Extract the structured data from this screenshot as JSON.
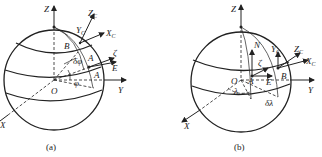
{
  "figure": {
    "panels": [
      {
        "id": "a",
        "caption": "(a)",
        "axes": {
          "z": "Z",
          "y": "Y",
          "x": "X",
          "zc": "Z",
          "zc_sub": "C",
          "yc": "Y",
          "yc_sub": "C",
          "xc": "X",
          "xc_sub": "C",
          "zeta": "ζ",
          "e": "E"
        },
        "points": {
          "origin": "O",
          "a_upper": "A",
          "a_lower": "A",
          "b": "B"
        },
        "angles": {
          "phi": "φ",
          "delta_phi": "δφ"
        }
      },
      {
        "id": "b",
        "caption": "(b)",
        "axes": {
          "z": "Z",
          "y": "Y",
          "x": "X",
          "zc": "Z",
          "zc_sub": "C",
          "yc": "Y",
          "yc_sub": "C",
          "xc": "X",
          "xc_sub": "C",
          "zeta": "ζ",
          "e": "E",
          "n": "N"
        },
        "points": {
          "origin": "O",
          "a": "A",
          "b": "B"
        },
        "angles": {
          "lambda": "λ",
          "delta_lambda": "δλ"
        }
      }
    ]
  }
}
